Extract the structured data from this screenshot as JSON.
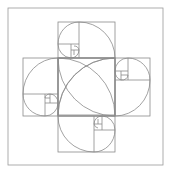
{
  "diagram": {
    "title": "",
    "description_visible": "Four golden rectangles with Fibonacci spirals arranged in a pinwheel inside a square frame",
    "line_color": "#8a8a8a",
    "frame_color": "#9a9a9a",
    "background": "#ffffff",
    "frame": {
      "x": 8,
      "y": 8,
      "w": 155,
      "h": 157
    },
    "rectangles": [
      {
        "id": "top",
        "x": 58,
        "y": 22,
        "w": 57,
        "h": 93
      },
      {
        "id": "right",
        "x": 58,
        "y": 58,
        "w": 92,
        "h": 58
      },
      {
        "id": "bottom",
        "x": 58,
        "y": 58,
        "w": 57,
        "h": 94
      },
      {
        "id": "left",
        "x": 23,
        "y": 58,
        "w": 92,
        "h": 58
      }
    ]
  }
}
